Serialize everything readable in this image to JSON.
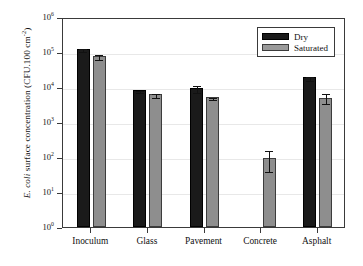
{
  "chart_data": {
    "type": "bar",
    "title": "",
    "xlabel": "",
    "ylabel_parts": {
      "italic": "E. coli",
      "rest": " surface concentration (CFU.100 cm",
      "exponent": "-2",
      "tail": ")"
    },
    "ylabel": "E. coli surface concentration (CFU.100 cm-2)",
    "categories": [
      "Inoculum",
      "Glass",
      "Pavement",
      "Concrete",
      "Asphalt"
    ],
    "yscale": "log",
    "ylim": [
      1,
      1000000
    ],
    "ytick_values": [
      1,
      10,
      100,
      1000,
      10000,
      100000,
      1000000
    ],
    "ytick_labels": [
      "10",
      "10",
      "10",
      "10",
      "10",
      "10",
      "10"
    ],
    "ytick_exponents": [
      "0",
      "1",
      "2",
      "3",
      "4",
      "5",
      "6"
    ],
    "grid": true,
    "legend_position": "top-right",
    "series": [
      {
        "name": "Dry",
        "color": "#1a1a1a",
        "values": [
          125000,
          8200,
          9500,
          null,
          19500
        ],
        "err_low": [
          115000,
          7600,
          7800,
          null,
          17000
        ],
        "err_high": [
          135000,
          8800,
          12000,
          null,
          22500
        ]
      },
      {
        "name": "Saturated",
        "color": "#8e8e8e",
        "values": [
          78000,
          6500,
          5200,
          95,
          4900
        ],
        "err_low": [
          68000,
          5700,
          4900,
          42,
          3700
        ],
        "err_high": [
          92000,
          7400,
          5600,
          165,
          7000
        ]
      }
    ]
  },
  "legend": {
    "items": [
      {
        "label": "Dry",
        "swatch": "dry"
      },
      {
        "label": "Saturated",
        "swatch": "sat"
      }
    ]
  }
}
